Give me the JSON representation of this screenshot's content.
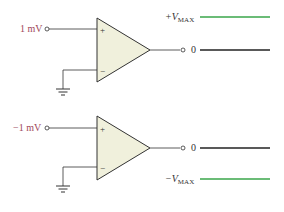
{
  "colors": {
    "wire": "#333333",
    "opamp_fill": "#f0f0dc",
    "opamp_stroke": "#333333",
    "input_label": "#a0485a",
    "rail_line": "#3aa64a",
    "zero_line": "#222222",
    "text": "#333333"
  },
  "circuits": [
    {
      "input_label": "1 mV",
      "plus_sign": "+",
      "minus_sign": "−",
      "output_label": "0",
      "rail_prefix": "+V",
      "rail_sub": "MAX",
      "rail_position": "top"
    },
    {
      "input_label": "−1 mV",
      "plus_sign": "+",
      "minus_sign": "−",
      "output_label": "0",
      "rail_prefix": "−V",
      "rail_sub": "MAX",
      "rail_position": "bottom"
    }
  ]
}
